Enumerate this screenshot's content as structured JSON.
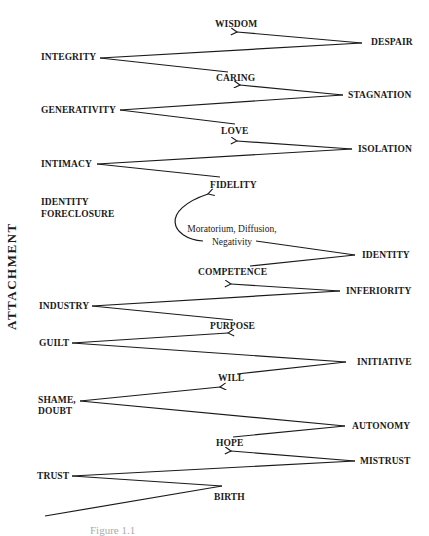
{
  "axis_label": "ATTACHMENT",
  "stages": {
    "integrity": "INTEGRITY",
    "despair": "DESPAIR",
    "wisdom": "WISDOM",
    "caring": "CARING",
    "stagnation": "STAGNATION",
    "generativity": "GENERATIVITY",
    "love": "LOVE",
    "isolation": "ISOLATION",
    "intimacy": "INTIMACY",
    "fidelity": "FIDELITY",
    "identity_foreclosure_1": "IDENTITY",
    "identity_foreclosure_2": "FORECLOSURE",
    "moratorium_1": "Moratorium, Diffusion,",
    "moratorium_2": "Negativity",
    "identity": "IDENTITY",
    "competence": "COMPETENCE",
    "inferiority": "INFERIORITY",
    "industry": "INDUSTRY",
    "purpose": "PURPOSE",
    "guilt": "GUILT",
    "initiative": "INITIATIVE",
    "will": "WILL",
    "shame_1": "SHAME,",
    "shame_2": "DOUBT",
    "autonomy": "AUTONOMY",
    "hope": "HOPE",
    "mistrust": "MISTRUST",
    "trust": "TRUST",
    "birth": "BIRTH"
  },
  "caption": "Figure 1.1"
}
